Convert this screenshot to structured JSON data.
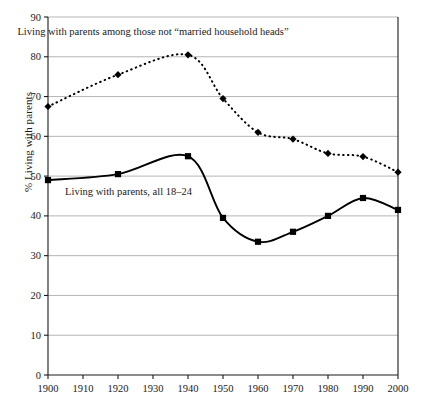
{
  "chart_data": {
    "type": "line",
    "title": "",
    "xlabel": "",
    "ylabel": "% Living with parents",
    "x": [
      1900,
      1910,
      1920,
      1930,
      1940,
      1950,
      1960,
      1970,
      1980,
      1990,
      2000
    ],
    "xtick_labels": [
      "1900",
      "1910",
      "1920",
      "1930",
      "1940",
      "1950",
      "1960",
      "1970",
      "1980",
      "1990",
      "2000"
    ],
    "xlim": [
      1900,
      2000
    ],
    "ylim": [
      0,
      90
    ],
    "ytick_labels": [
      "0",
      "10",
      "20",
      "30",
      "40",
      "50",
      "60",
      "70",
      "80",
      "90"
    ],
    "yticks": [
      0,
      10,
      20,
      30,
      40,
      50,
      60,
      70,
      80,
      90
    ],
    "grid": true,
    "legend_position": "inline-annotations",
    "series": [
      {
        "name": "Living with parents among those not \"married household heads\"",
        "style": "dashed",
        "marker": "diamond",
        "color": "#000000",
        "x": [
          1900,
          1920,
          1940,
          1950,
          1960,
          1970,
          1980,
          1990,
          2000
        ],
        "values": [
          67.5,
          75.5,
          80.5,
          69.5,
          61.0,
          59.3,
          55.7,
          54.9,
          51.0
        ]
      },
      {
        "name": "Living with parents, all 18–24",
        "style": "solid",
        "marker": "square",
        "color": "#000000",
        "x": [
          1900,
          1920,
          1940,
          1950,
          1960,
          1970,
          1980,
          1990,
          2000
        ],
        "values": [
          49.0,
          50.5,
          55.0,
          39.5,
          33.5,
          36.0,
          40.0,
          44.5,
          41.5
        ]
      }
    ],
    "annotations": [
      {
        "id": "upper",
        "text": "Living with parents among those not “married household heads”",
        "x": 1930,
        "y": 85.5
      },
      {
        "id": "lower",
        "text": "Living with parents, all 18–24",
        "x": 1923,
        "y": 45.2
      }
    ]
  },
  "colors": {
    "axis": "#1a1a1a",
    "grid": "#b5b5b5",
    "series": "#000000",
    "background": "#ffffff"
  }
}
